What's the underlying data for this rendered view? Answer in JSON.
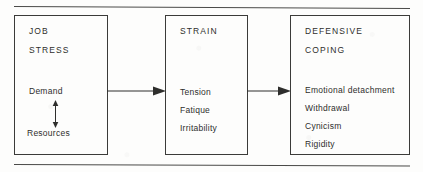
{
  "figure": {
    "stroke_color": "#3b3b39",
    "text_color": "#2e2e2c",
    "background_color": "#fdfdfc"
  },
  "rules": {
    "top_label": "top-horizontal-rule",
    "bottom_label": "bottom-horizontal-rule"
  },
  "boxes": [
    {
      "id": "job-stress",
      "headings": [
        "JOB",
        "STRESS"
      ],
      "items": [
        "Demand",
        "Resources"
      ],
      "internal_relation": "bidirectional-vertical-arrow"
    },
    {
      "id": "strain",
      "headings": [
        "STRAIN"
      ],
      "items": [
        "Tension",
        "Fatique",
        "Irritability"
      ]
    },
    {
      "id": "defensive-coping",
      "headings": [
        "DEFENSIVE",
        "COPING"
      ],
      "items": [
        "Emotional detachment",
        "Withdrawal",
        "Cynicism",
        "Rigidity"
      ]
    }
  ],
  "connectors": [
    {
      "id": "stress-to-strain",
      "from": "job-stress",
      "to": "strain",
      "direction": "right"
    },
    {
      "id": "strain-to-coping",
      "from": "strain",
      "to": "defensive-coping",
      "direction": "right"
    }
  ]
}
